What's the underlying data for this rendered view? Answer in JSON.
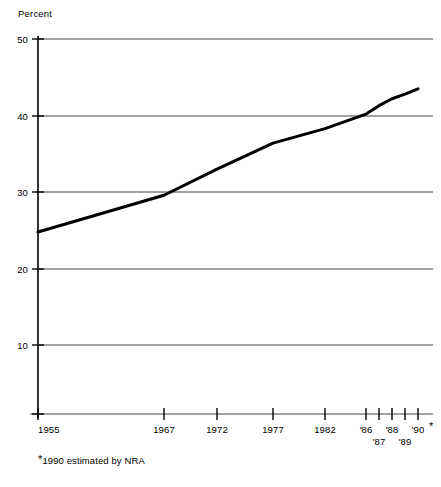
{
  "chart_data": {
    "type": "line",
    "title": "",
    "subtitle": "",
    "xlabel": "",
    "ylabel": "Percent",
    "ylim": [
      0,
      50
    ],
    "yticks": [
      10,
      20,
      30,
      40,
      50
    ],
    "ytick_labels": [
      "10",
      "20",
      "30",
      "40",
      "50"
    ],
    "grid": true,
    "legend": null,
    "x": [
      1955,
      1967,
      1972,
      1977,
      1982,
      1986,
      1987,
      1988,
      1989,
      1990
    ],
    "xtick_labels": [
      "1955",
      "1967",
      "1972",
      "1977",
      "1982",
      "'86",
      "'87",
      "'88",
      "'89",
      "'90"
    ],
    "values": [
      24.8,
      29.6,
      33.0,
      36.4,
      38.3,
      40.2,
      41.3,
      42.2,
      42.8,
      43.5
    ],
    "series": [
      {
        "name": "Percent",
        "values": [
          24.8,
          29.6,
          33.0,
          36.4,
          38.3,
          40.2,
          41.3,
          42.2,
          42.8,
          43.5
        ]
      }
    ],
    "annotations": [
      "*1990 estimated by NRA"
    ],
    "line_color": "#000000",
    "axis_color": "#000000",
    "grid_color": "#555555"
  },
  "axis": {
    "y_title": "Percent",
    "y_ticks": [
      {
        "label": "50",
        "value": 50
      },
      {
        "label": "40",
        "value": 40
      },
      {
        "label": "30",
        "value": 30
      },
      {
        "label": "20",
        "value": 20
      },
      {
        "label": "10",
        "value": 10
      }
    ],
    "x_ticks_row1": [
      {
        "label": "1955"
      },
      {
        "label": "1967"
      },
      {
        "label": "1972"
      },
      {
        "label": "1977"
      },
      {
        "label": "1982"
      },
      {
        "label": "'86"
      },
      {
        "label": "'88"
      },
      {
        "label": "'90"
      }
    ],
    "x_ticks_row2": [
      {
        "label": "'87"
      },
      {
        "label": "'89"
      }
    ],
    "estimate_marker": "*"
  },
  "footnote": {
    "marker": "*",
    "text": "1990 estimated by NRA"
  }
}
